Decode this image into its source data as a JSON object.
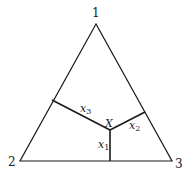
{
  "diagram": {
    "type": "ternary-simplex",
    "vertices": [
      {
        "label": "1",
        "x": 96,
        "y": 24
      },
      {
        "label": "2",
        "x": 20,
        "y": 161
      },
      {
        "label": "3",
        "x": 172,
        "y": 161
      }
    ],
    "point": {
      "label": "X",
      "x": 110,
      "y": 130
    },
    "distances": [
      {
        "name": "x",
        "sub": "1",
        "to_side": "2-3"
      },
      {
        "name": "x",
        "sub": "2",
        "to_side": "1-3"
      },
      {
        "name": "x",
        "sub": "3",
        "to_side": "1-2"
      }
    ],
    "colors": {
      "line": "#1a1a1a",
      "background": "#ffffff"
    }
  }
}
